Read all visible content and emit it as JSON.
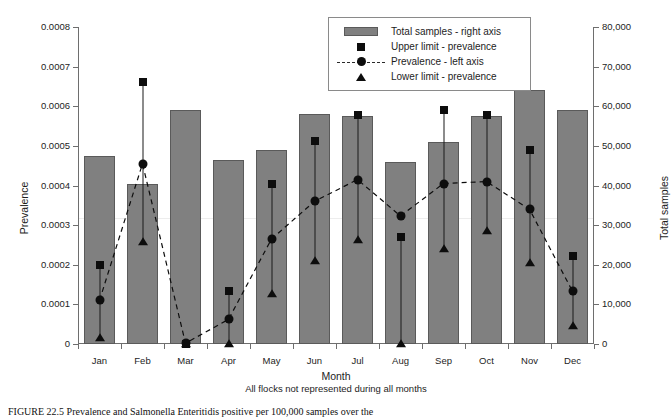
{
  "chart_data": {
    "type": "bar",
    "title": "",
    "xlabel": "Month",
    "xlabel_note": "All flocks not represented during all months",
    "ylabel": "Prevalence",
    "ylabel_secondary": "Total samples",
    "categories": [
      "Jan",
      "Feb",
      "Mar",
      "Apr",
      "May",
      "Jun",
      "Jul",
      "Aug",
      "Sep",
      "Oct",
      "Nov",
      "Dec"
    ],
    "ylim": [
      0,
      0.0008
    ],
    "ylim_secondary": [
      0,
      80000
    ],
    "grid": false,
    "legend_position": "top-right",
    "series": [
      {
        "name": "Total samples - right axis",
        "axis": "right",
        "type": "bar",
        "values": [
          47500,
          40500,
          59000,
          46500,
          49000,
          58000,
          57500,
          46000,
          51000,
          57500,
          64000,
          59000
        ]
      },
      {
        "name": "Prevalence - left axis",
        "axis": "left",
        "type": "line",
        "values": [
          0.00011,
          0.000455,
          2e-06,
          6.2e-05,
          0.000265,
          0.00036,
          0.000415,
          0.000323,
          0.000405,
          0.00041,
          0.00034,
          0.000133
        ]
      },
      {
        "name": "Upper limit - prevalence",
        "axis": "left",
        "type": "scatter",
        "values": [
          0.0002,
          0.000662,
          0.0,
          0.000135,
          0.000405,
          0.000512,
          0.000578,
          0.00027,
          0.00059,
          0.000578,
          0.00049,
          0.000222
        ]
      },
      {
        "name": "Lower limit - prevalence",
        "axis": "left",
        "type": "scatter",
        "values": [
          1.5e-05,
          0.000258,
          0.0,
          0.0,
          0.000125,
          0.00021,
          0.000262,
          0.0,
          0.00024,
          0.000285,
          0.000205,
          4.5e-05
        ]
      }
    ],
    "y_ticks_left": [
      "0",
      "0.0001",
      "0.0002",
      "0.0003",
      "0.0004",
      "0.0005",
      "0.0006",
      "0.0007",
      "0.0008"
    ],
    "y_ticks_right": [
      "0",
      "10,000",
      "20,000",
      "30,000",
      "40,000",
      "50,000",
      "60,000",
      "70,000",
      "80,000"
    ],
    "colors": {
      "bar_fill": "#808080",
      "bar_border": "#5a5a5a",
      "marker": "#0d0d0d",
      "axis": "#6e6e6e",
      "text": "#1d1d1d"
    }
  },
  "legend": {
    "items": [
      {
        "label": "Total samples - right axis",
        "key": "bar-swatch"
      },
      {
        "label": "Upper limit - prevalence",
        "key": "square-marker"
      },
      {
        "label": "Prevalence - left axis",
        "key": "dashed-line-circle-marker"
      },
      {
        "label": "Lower limit - prevalence",
        "key": "triangle-marker"
      }
    ]
  },
  "caption": {
    "text": "FIGURE 22.5   Prevalence and Salmonella Enteritidis positive per 100,000 samples over the"
  }
}
